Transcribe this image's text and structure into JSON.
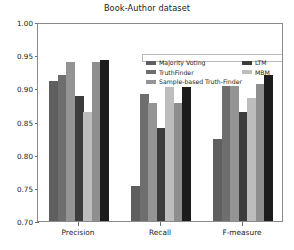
{
  "chart_data": {
    "type": "bar",
    "title": "Book-Author dataset",
    "xlabel": "",
    "ylabel": "",
    "categories": [
      "Precision",
      "Recall",
      "F-measure"
    ],
    "ylim": [
      0.7,
      1.0
    ],
    "yticks": [
      "0.70",
      "0.75",
      "0.80",
      "0.85",
      "0.90",
      "0.95",
      "1.00"
    ],
    "ytick_values": [
      0.7,
      0.75,
      0.8,
      0.85,
      0.9,
      0.95,
      1.0
    ],
    "grid": false,
    "legend_position": "upper center",
    "series": [
      {
        "name": "Majority Voting",
        "color": "#5f5f5f",
        "values": [
          0.911,
          0.753,
          0.823
        ]
      },
      {
        "name": "TruthFinder",
        "color": "#6e6e6e",
        "values": [
          0.92,
          0.892,
          0.903
        ]
      },
      {
        "name": "Sample-based Truth-Finder",
        "color": "#949494",
        "values": [
          0.94,
          0.878,
          0.903
        ]
      },
      {
        "name": "LTM",
        "color": "#3c3c3c",
        "values": [
          0.888,
          0.84,
          0.865
        ]
      },
      {
        "name": "MBM",
        "color": "#bdbdbd",
        "values": [
          0.864,
          0.902,
          0.885
        ]
      },
      {
        "name": "HYBRID",
        "color": "#8e8e8e",
        "values": [
          0.94,
          0.878,
          0.907
        ]
      },
      {
        "name": "HTDF",
        "color": "#1c1c1c",
        "values": [
          0.943,
          0.902,
          0.92
        ]
      }
    ]
  },
  "legend": {
    "columns": [
      {
        "name": "legend-column-left",
        "items": [
          0,
          1,
          2
        ]
      },
      {
        "name": "legend-column-middle",
        "items": [
          3,
          4
        ]
      },
      {
        "name": "legend-column-right",
        "items": [
          5,
          6
        ]
      }
    ]
  },
  "axis": {
    "frame_color": "#8a8a8a",
    "tick_color": "#6f6f6f"
  }
}
